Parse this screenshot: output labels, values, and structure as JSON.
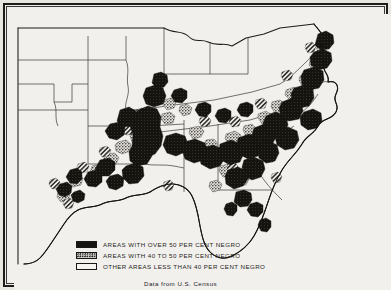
{
  "figure": {
    "credit": "Data from U.S. Census",
    "region": "Southeastern United States"
  },
  "legend": {
    "items": [
      {
        "key": "over50",
        "label": "AREAS WITH OVER 50 PER CENT NEGRO",
        "pattern": "solid-black",
        "color": "#16150f"
      },
      {
        "key": "40to50",
        "label": "AREAS WITH 40 TO 50 PER CENT NEGRO",
        "pattern": "stipple-gray",
        "color": "#cfccc6"
      },
      {
        "key": "under40",
        "label": "OTHER AREAS LESS THAN 40 PER CENT NEGRO",
        "pattern": "white",
        "color": "#f6f4f1"
      }
    ]
  },
  "map_data": {
    "type": "choropleth",
    "classes": [
      "over 50 per cent",
      "40 to 50 per cent",
      "less than 40 per cent"
    ],
    "states_outlined": [
      "Texas",
      "Oklahoma",
      "Kansas",
      "Missouri",
      "Arkansas",
      "Louisiana",
      "Mississippi",
      "Alabama",
      "Georgia",
      "Florida",
      "South Carolina",
      "North Carolina",
      "Tennessee",
      "Kentucky",
      "Virginia",
      "West Virginia",
      "Maryland",
      "Delaware",
      "Illinois",
      "Indiana",
      "Ohio"
    ],
    "high_density_regions": [
      "Mississippi Delta",
      "Alabama Black Belt",
      "Georgia Black Belt",
      "South Carolina Low Country",
      "North Carolina Coastal Plain",
      "Virginia Southside",
      "Tidewater Virginia",
      "East Texas",
      "Red River Valley Louisiana"
    ]
  },
  "colors": {
    "paper": "#f2f0ed",
    "ink": "#1d1c1a",
    "frame": "#1d1c1a",
    "water": "#f2f0ed"
  }
}
